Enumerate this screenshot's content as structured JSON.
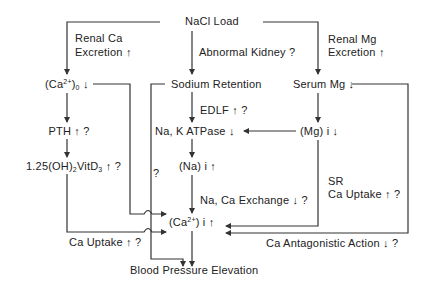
{
  "diagram": {
    "root": "NaCl Load",
    "edge_labels": {
      "renal_ca": [
        "Renal Ca",
        "Excretion ↑"
      ],
      "abnormal_kidney": "Abnormal Kidney ?",
      "renal_mg": [
        "Renal Mg",
        "Excretion ↑"
      ],
      "edlf": "EDLF ↑ ?",
      "na_ca_exchange": "Na, Ca Exchange ↓ ?",
      "sr_ca_uptake": [
        "SR",
        "Ca Uptake ↑ ?"
      ],
      "ca_uptake": "Ca Uptake ↑ ?",
      "ca_antagonistic": "Ca Antagonistic  Action ↓ ?",
      "question": "?"
    },
    "nodes": {
      "ca_o": {
        "pre": "(Ca",
        "sup": "2+",
        "mid": ")",
        "sub": "0",
        "post": " ↓"
      },
      "sodium_retention": "Sodium Retention",
      "serum_mg": "Serum Mg ↓",
      "pth": "PTH ↑ ?",
      "vitd3": {
        "pre": "1.25(OH)",
        "sub1": "2",
        "mid": "VitD",
        "sub2": "3",
        "post": " ↑ ?"
      },
      "na_k_atpase": "Na, K ATPase ↓",
      "mg_i": "(Mg) i ↓",
      "na_i": "(Na) i ↑",
      "ca_i": {
        "pre": "(Ca",
        "sup": "2+",
        "post": ") i ↑"
      },
      "blood_pressure": "Blood Pressure Elevation"
    },
    "line_color": "#333333"
  }
}
